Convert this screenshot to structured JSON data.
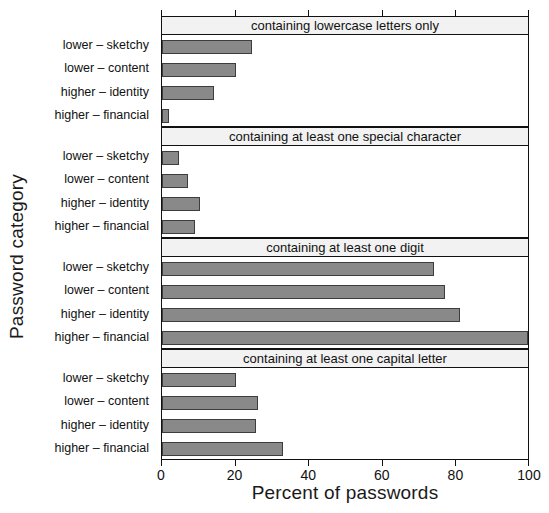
{
  "chart_data": {
    "type": "bar",
    "orientation": "horizontal",
    "title": "",
    "xlabel": "Percent of passwords",
    "ylabel": "Password category",
    "xlim": [
      0,
      100
    ],
    "xticks": [
      0,
      20,
      40,
      60,
      80,
      100
    ],
    "xtick_labels": [
      "0",
      "20",
      "40",
      "60",
      "80",
      "100"
    ],
    "grid": false,
    "legend": null,
    "categories": [
      "lower – sketchy",
      "lower – content",
      "higher – identity",
      "higher – financial"
    ],
    "panels": [
      {
        "strip_label": "containing lowercase letters only",
        "values": [
          24.5,
          20.0,
          14.0,
          1.8
        ]
      },
      {
        "strip_label": "containing at least one special character",
        "values": [
          4.7,
          7.0,
          10.4,
          9.0
        ]
      },
      {
        "strip_label": "containing at least one digit",
        "values": [
          74.0,
          77.0,
          81.0,
          99.8
        ]
      },
      {
        "strip_label": "containing at least one capital letter",
        "values": [
          20.0,
          26.0,
          25.5,
          33.0
        ]
      }
    ],
    "colors": {
      "bar_fill": "#898989",
      "bar_stroke": "#3d3d3d",
      "strip_fill": "#f2f2f2",
      "axis": "#111111",
      "background": "#ffffff"
    }
  }
}
